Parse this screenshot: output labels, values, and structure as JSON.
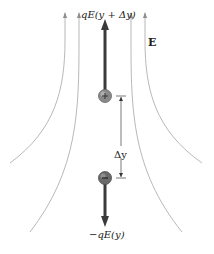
{
  "diagram": {
    "labels": {
      "top_force": "qE(y + Δy)",
      "bottom_force": "−qE(y)",
      "field": "E",
      "separation": "Δy"
    },
    "charges": {
      "top": {
        "sign": "+",
        "y": 96
      },
      "bottom": {
        "sign": "−",
        "y": 178
      }
    },
    "colors": {
      "field_line": "#a8a8a8",
      "force_arrow": "#3a3a3a",
      "charge_fill": "#7a7a7a",
      "dimension_line": "#555555"
    }
  }
}
